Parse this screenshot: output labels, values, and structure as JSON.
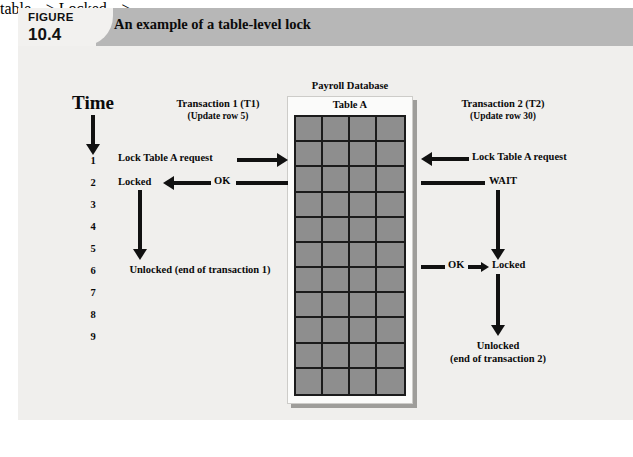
{
  "figure": {
    "label_word": "FIGURE",
    "number": "10.4",
    "title": "An example of a table-level lock"
  },
  "time_axis": {
    "title": "Time",
    "ticks": [
      "1",
      "2",
      "3",
      "4",
      "5",
      "6",
      "7",
      "8",
      "9"
    ]
  },
  "transaction1": {
    "title": "Transaction 1 (T1)",
    "subtitle": "(Update row 5)",
    "request_label": "Lock Table A request",
    "ok_label": "OK",
    "locked_label": "Locked",
    "unlocked_label": "Unlocked (end of transaction 1)"
  },
  "transaction2": {
    "title": "Transaction 2 (T2)",
    "subtitle": "(Update row 30)",
    "request_label": "Lock Table A request",
    "wait_label": "WAIT",
    "ok_label": "OK",
    "locked_label": "Locked",
    "unlocked_label": "Unlocked",
    "unlocked_sub": "(end of transaction 2)"
  },
  "database": {
    "caption": "Payroll Database",
    "table_name": "Table A",
    "grid_columns": 4,
    "grid_rows": 11
  },
  "colors": {
    "header_band": "#b7b7b7",
    "header_block": "#f2f1ef",
    "body_background": "#f0efed",
    "grid_fill": "#8e8e8e",
    "grid_line": "#1b1b1b",
    "arrow": "#111111",
    "panel": "#fbfbfa"
  }
}
